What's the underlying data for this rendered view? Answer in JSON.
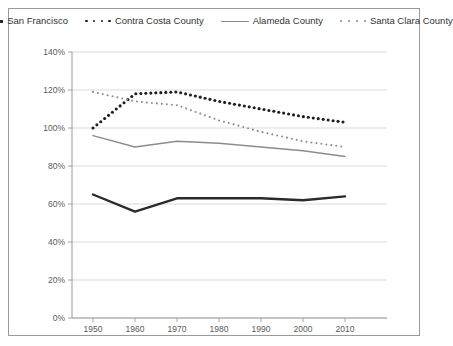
{
  "legend": {
    "items": [
      {
        "label": "San Francisco",
        "style": "solid-thick",
        "color": "#2b2b2b"
      },
      {
        "label": "Contra Costa County",
        "style": "dotted-bold",
        "color": "#1f1f1f"
      },
      {
        "label": "Alameda County",
        "style": "solid-thin",
        "color": "#8c8c8c"
      },
      {
        "label": "Santa Clara County",
        "style": "dotted-fine",
        "color": "#8e8e8e"
      }
    ]
  },
  "chart_data": {
    "type": "line",
    "title": "",
    "subtitle": "",
    "xlabel": "",
    "ylabel": "",
    "x": [
      1950,
      1960,
      1970,
      1980,
      1990,
      2000,
      2010
    ],
    "xtick_labels": [
      "1950",
      "1960",
      "1970",
      "1980",
      "1990",
      "2000",
      "2010"
    ],
    "xlim": [
      1945,
      2020
    ],
    "ylim": [
      0,
      140
    ],
    "yticks": [
      0,
      20,
      40,
      60,
      80,
      100,
      120,
      140
    ],
    "ytick_labels": [
      "0%",
      "20%",
      "40%",
      "60%",
      "80%",
      "100%",
      "120%",
      "140%"
    ],
    "grid": "horizontal",
    "legend_position": "top",
    "series": [
      {
        "name": "San Francisco",
        "style": "solid-thick",
        "color": "#2b2b2b",
        "values": [
          65,
          56,
          63,
          63,
          63,
          62,
          64
        ]
      },
      {
        "name": "Contra Costa County",
        "style": "dotted-bold",
        "color": "#1f1f1f",
        "values": [
          100,
          118,
          119,
          114,
          110,
          106,
          103
        ]
      },
      {
        "name": "Alameda County",
        "style": "solid-thin",
        "color": "#8c8c8c",
        "values": [
          96,
          90,
          93,
          92,
          90,
          88,
          85
        ]
      },
      {
        "name": "Santa Clara County",
        "style": "dotted-fine",
        "color": "#8e8e8e",
        "values": [
          119,
          114,
          112,
          104,
          98,
          93,
          90
        ]
      }
    ]
  }
}
